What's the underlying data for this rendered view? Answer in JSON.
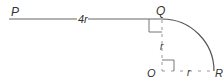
{
  "diagram": {
    "points": {
      "P": {
        "label": "P"
      },
      "Q": {
        "label": "Q"
      },
      "O": {
        "label": "O"
      },
      "R": {
        "label": "R"
      }
    },
    "segments": {
      "PQ": {
        "label": "4r",
        "style": "solid"
      },
      "QO": {
        "label": "r",
        "style": "dashed"
      },
      "OR": {
        "label": "r",
        "style": "dashed"
      },
      "arc_QR": {
        "label": "",
        "style": "solid",
        "type": "quarter-circle",
        "center": "O"
      }
    },
    "right_angles": [
      "at Q (between PQ and QO)",
      "at O (between QO and OR)"
    ],
    "colors": {
      "line": "#555555",
      "dashed": "#888888",
      "text": "#333333"
    }
  }
}
